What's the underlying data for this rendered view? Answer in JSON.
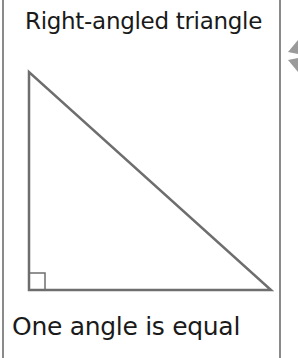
{
  "title": "Right-angled triangle",
  "caption": "One angle is equal",
  "diagram": {
    "shape": "right-angled-triangle",
    "vertices": [
      [
        29,
        72
      ],
      [
        29,
        290
      ],
      [
        271,
        290
      ]
    ],
    "right_angle_marker": {
      "x": 29,
      "y": 273,
      "size": 16
    },
    "stroke_color": "#6e6e6e"
  },
  "colors": {
    "border": "#8a8a8a",
    "text": "#1a1a1a",
    "arrow": "#9a9a9a"
  }
}
